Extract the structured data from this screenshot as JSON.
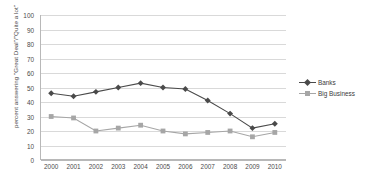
{
  "chart_data": {
    "type": "line",
    "title": "",
    "xlabel": "",
    "ylabel": "percent answering \"Great Deal\"/\"Quite a lot\"",
    "categories": [
      "2000",
      "2001",
      "2002",
      "2003",
      "2004",
      "2005",
      "2006",
      "2007",
      "2008",
      "2009",
      "2010"
    ],
    "x": [
      2000,
      2001,
      2002,
      2003,
      2004,
      2005,
      2006,
      2007,
      2008,
      2009,
      2010
    ],
    "ylim": [
      0,
      100
    ],
    "yticks": [
      0,
      10,
      20,
      30,
      40,
      50,
      60,
      70,
      80,
      90,
      100
    ],
    "grid": true,
    "legend_position": "right",
    "series": [
      {
        "name": "Banks",
        "color": "#4a4a4a",
        "marker": "diamond",
        "values": [
          46,
          44,
          47,
          50,
          53,
          50,
          49,
          41,
          32,
          22,
          25
        ]
      },
      {
        "name": "Big Business",
        "color": "#a6a6a6",
        "marker": "square",
        "values": [
          30,
          29,
          20,
          22,
          24,
          20,
          18,
          19,
          20,
          16,
          19
        ]
      }
    ]
  },
  "legend": {
    "items": [
      {
        "label": "Banks"
      },
      {
        "label": "Big Business"
      }
    ]
  }
}
